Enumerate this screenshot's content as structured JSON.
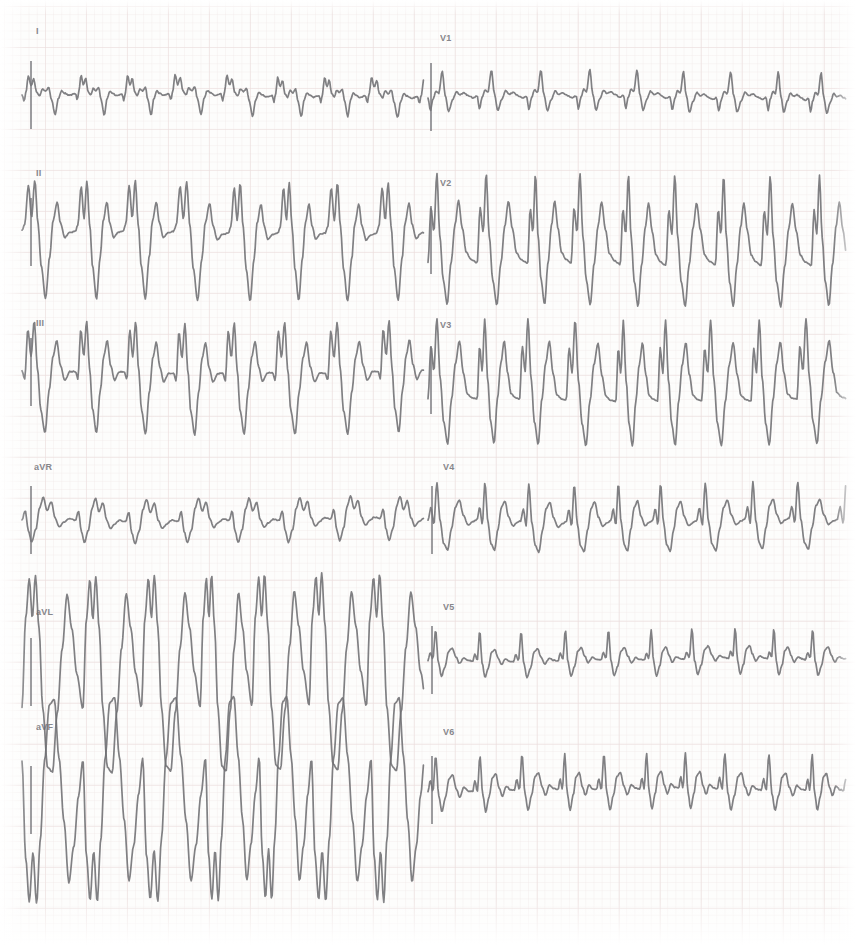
{
  "document": {
    "type": "electrocardiogram",
    "title": "12-lead ECG",
    "paper_color": "#fdfdfc",
    "grid_color": "#c49696",
    "trace_color": "#6e6e72",
    "width": 856,
    "height": 945
  },
  "layout": {
    "columns": 2,
    "rows": 6,
    "column_split_x": 428
  },
  "leads": [
    {
      "label": "I",
      "name": "lead-i",
      "column": "left",
      "row": 0,
      "label_x": 36,
      "label_y": 26,
      "baseline_y": 95,
      "cal_x": 30
    },
    {
      "label": "II",
      "name": "lead-ii",
      "column": "left",
      "row": 1,
      "label_x": 36,
      "label_y": 168,
      "baseline_y": 232,
      "cal_x": 30
    },
    {
      "label": "III",
      "name": "lead-iii",
      "column": "left",
      "row": 2,
      "label_x": 36,
      "label_y": 318,
      "baseline_y": 372,
      "cal_x": 30
    },
    {
      "label": "aVR",
      "name": "lead-avr",
      "column": "left",
      "row": 3,
      "label_x": 34,
      "label_y": 462,
      "baseline_y": 520,
      "cal_x": 30
    },
    {
      "label": "aVL",
      "name": "lead-avl",
      "column": "left",
      "row": 4,
      "label_x": 36,
      "label_y": 607,
      "baseline_y": 672,
      "cal_x": 30
    },
    {
      "label": "aVF",
      "name": "lead-avf",
      "column": "left",
      "row": 5,
      "label_x": 36,
      "label_y": 722,
      "baseline_y": 800,
      "cal_x": 30
    },
    {
      "label": "V1",
      "name": "lead-v1",
      "column": "right",
      "row": 0,
      "label_x": 440,
      "label_y": 33,
      "baseline_y": 97,
      "cal_x": 430
    },
    {
      "label": "V2",
      "name": "lead-v2",
      "column": "right",
      "row": 1,
      "label_x": 440,
      "label_y": 178,
      "baseline_y": 240,
      "cal_x": 430
    },
    {
      "label": "V3",
      "name": "lead-v3",
      "column": "right",
      "row": 2,
      "label_x": 440,
      "label_y": 320,
      "baseline_y": 380,
      "cal_x": 430
    },
    {
      "label": "V4",
      "name": "lead-v4",
      "column": "right",
      "row": 3,
      "label_x": 443,
      "label_y": 462,
      "baseline_y": 520,
      "cal_x": 431
    },
    {
      "label": "V5",
      "name": "lead-v5",
      "column": "right",
      "row": 4,
      "label_x": 443,
      "label_y": 602,
      "baseline_y": 660,
      "cal_x": 431
    },
    {
      "label": "V6",
      "name": "lead-v6",
      "column": "right",
      "row": 5,
      "label_x": 443,
      "label_y": 727,
      "baseline_y": 790,
      "cal_x": 431
    }
  ],
  "chart_data": {
    "type": "line",
    "xlabel": "time",
    "ylabel": "amplitude (mV)",
    "grid": true,
    "legend": "none",
    "series": [
      {
        "name": "I",
        "x_start": 22,
        "x_end": 424,
        "beats": 8,
        "beat_width": 50,
        "amp": 1.0,
        "template": [
          [
            0.0,
            0.0
          ],
          [
            0.04,
            -0.22
          ],
          [
            0.07,
            0.05
          ],
          [
            0.12,
            0.62
          ],
          [
            0.17,
            0.3
          ],
          [
            0.22,
            0.52
          ],
          [
            0.27,
            0.08
          ],
          [
            0.33,
            -0.05
          ],
          [
            0.38,
            0.18
          ],
          [
            0.44,
            0.1
          ],
          [
            0.5,
            0.22
          ],
          [
            0.55,
            -0.18
          ],
          [
            0.62,
            -0.7
          ],
          [
            0.68,
            -0.15
          ],
          [
            0.74,
            0.1
          ],
          [
            0.8,
            0.02
          ],
          [
            0.88,
            -0.05
          ],
          [
            1.0,
            0.0
          ]
        ]
      },
      {
        "name": "II",
        "x_start": 22,
        "x_end": 424,
        "beats": 8,
        "beat_width": 50,
        "amp": 2.15,
        "template": [
          [
            0.0,
            0.0
          ],
          [
            0.05,
            0.1
          ],
          [
            0.12,
            0.7
          ],
          [
            0.18,
            0.2
          ],
          [
            0.24,
            0.78
          ],
          [
            0.3,
            0.1
          ],
          [
            0.36,
            -0.55
          ],
          [
            0.44,
            -1.05
          ],
          [
            0.52,
            -0.4
          ],
          [
            0.58,
            0.15
          ],
          [
            0.66,
            0.45
          ],
          [
            0.72,
            0.12
          ],
          [
            0.8,
            -0.1
          ],
          [
            0.9,
            -0.02
          ],
          [
            1.0,
            0.0
          ]
        ]
      },
      {
        "name": "III",
        "x_start": 22,
        "x_end": 424,
        "beats": 8,
        "beat_width": 50,
        "amp": 2.05,
        "template": [
          [
            0.0,
            0.0
          ],
          [
            0.05,
            -0.12
          ],
          [
            0.11,
            0.68
          ],
          [
            0.17,
            0.25
          ],
          [
            0.23,
            0.82
          ],
          [
            0.29,
            0.05
          ],
          [
            0.35,
            -0.62
          ],
          [
            0.43,
            -1.0
          ],
          [
            0.51,
            -0.3
          ],
          [
            0.58,
            0.25
          ],
          [
            0.65,
            0.5
          ],
          [
            0.72,
            0.1
          ],
          [
            0.8,
            -0.14
          ],
          [
            0.9,
            0.0
          ],
          [
            1.0,
            0.0
          ]
        ]
      },
      {
        "name": "aVR",
        "x_start": 22,
        "x_end": 424,
        "beats": 8,
        "beat_width": 50,
        "amp": 1.05,
        "template": [
          [
            0.0,
            0.0
          ],
          [
            0.06,
            0.3
          ],
          [
            0.12,
            -0.35
          ],
          [
            0.18,
            -0.7
          ],
          [
            0.26,
            -0.3
          ],
          [
            0.33,
            0.38
          ],
          [
            0.4,
            0.72
          ],
          [
            0.47,
            0.3
          ],
          [
            0.55,
            0.58
          ],
          [
            0.62,
            0.05
          ],
          [
            0.7,
            -0.22
          ],
          [
            0.78,
            -0.08
          ],
          [
            0.88,
            0.04
          ],
          [
            1.0,
            0.0
          ]
        ]
      },
      {
        "name": "aVL",
        "x_start": 22,
        "x_end": 424,
        "beats": 7,
        "beat_width": 57,
        "amp": 3.3,
        "template": [
          [
            0.0,
            -0.35
          ],
          [
            0.06,
            0.55
          ],
          [
            0.12,
            0.95
          ],
          [
            0.17,
            0.55
          ],
          [
            0.22,
            0.98
          ],
          [
            0.28,
            0.45
          ],
          [
            0.34,
            -0.35
          ],
          [
            0.42,
            -0.95
          ],
          [
            0.5,
            -1.0
          ],
          [
            0.58,
            -0.4
          ],
          [
            0.66,
            0.25
          ],
          [
            0.74,
            0.8
          ],
          [
            0.82,
            0.45
          ],
          [
            0.9,
            0.0
          ],
          [
            1.0,
            -0.35
          ]
        ]
      },
      {
        "name": "aVF",
        "x_start": 22,
        "x_end": 424,
        "beats": 7,
        "beat_width": 57,
        "amp": 3.4,
        "template": [
          [
            0.0,
            0.4
          ],
          [
            0.06,
            -0.55
          ],
          [
            0.12,
            -0.98
          ],
          [
            0.18,
            -0.5
          ],
          [
            0.24,
            -1.0
          ],
          [
            0.3,
            -0.38
          ],
          [
            0.37,
            0.4
          ],
          [
            0.45,
            0.95
          ],
          [
            0.53,
            1.0
          ],
          [
            0.61,
            0.42
          ],
          [
            0.69,
            -0.2
          ],
          [
            0.77,
            -0.8
          ],
          [
            0.85,
            -0.45
          ],
          [
            0.93,
            0.05
          ],
          [
            1.0,
            0.4
          ]
        ]
      },
      {
        "name": "V1",
        "x_start": 428,
        "x_end": 846,
        "beats": 9,
        "beat_width": 46,
        "amp": 1.15,
        "template": [
          [
            0.0,
            0.0
          ],
          [
            0.05,
            -0.38
          ],
          [
            0.1,
            -0.05
          ],
          [
            0.16,
            0.18
          ],
          [
            0.22,
            0.12
          ],
          [
            0.29,
            0.75
          ],
          [
            0.35,
            0.05
          ],
          [
            0.42,
            -0.42
          ],
          [
            0.5,
            -0.1
          ],
          [
            0.58,
            0.15
          ],
          [
            0.65,
            0.05
          ],
          [
            0.73,
            0.1
          ],
          [
            0.82,
            0.02
          ],
          [
            0.92,
            -0.05
          ],
          [
            1.0,
            0.0
          ]
        ]
      },
      {
        "name": "V2",
        "x_start": 428,
        "x_end": 846,
        "beats": 9,
        "beat_width": 46,
        "amp": 2.3,
        "template": [
          [
            0.0,
            -0.35
          ],
          [
            0.06,
            0.45
          ],
          [
            0.12,
            0.1
          ],
          [
            0.18,
            0.95
          ],
          [
            0.24,
            0.05
          ],
          [
            0.31,
            -0.6
          ],
          [
            0.39,
            -0.95
          ],
          [
            0.47,
            -0.35
          ],
          [
            0.55,
            0.2
          ],
          [
            0.62,
            0.55
          ],
          [
            0.7,
            0.15
          ],
          [
            0.78,
            -0.2
          ],
          [
            0.88,
            -0.3
          ],
          [
            1.0,
            -0.35
          ]
        ]
      },
      {
        "name": "V3",
        "x_start": 428,
        "x_end": 846,
        "beats": 9,
        "beat_width": 46,
        "amp": 2.2,
        "template": [
          [
            0.0,
            -0.3
          ],
          [
            0.06,
            0.5
          ],
          [
            0.12,
            0.12
          ],
          [
            0.18,
            0.92
          ],
          [
            0.25,
            0.0
          ],
          [
            0.32,
            -0.65
          ],
          [
            0.4,
            -0.98
          ],
          [
            0.48,
            -0.3
          ],
          [
            0.56,
            0.25
          ],
          [
            0.64,
            0.58
          ],
          [
            0.72,
            0.1
          ],
          [
            0.8,
            -0.22
          ],
          [
            0.9,
            -0.28
          ],
          [
            1.0,
            -0.3
          ]
        ]
      },
      {
        "name": "V4",
        "x_start": 428,
        "x_end": 846,
        "beats": 9,
        "beat_width": 46,
        "amp": 1.45,
        "template": [
          [
            0.0,
            0.0
          ],
          [
            0.06,
            0.28
          ],
          [
            0.12,
            -0.1
          ],
          [
            0.18,
            0.85
          ],
          [
            0.25,
            -0.05
          ],
          [
            0.32,
            -0.55
          ],
          [
            0.4,
            -0.7
          ],
          [
            0.48,
            -0.2
          ],
          [
            0.56,
            0.3
          ],
          [
            0.64,
            0.45
          ],
          [
            0.72,
            0.1
          ],
          [
            0.82,
            -0.12
          ],
          [
            0.92,
            -0.04
          ],
          [
            1.0,
            0.0
          ]
        ]
      },
      {
        "name": "V5",
        "x_start": 428,
        "x_end": 846,
        "beats": 10,
        "beat_width": 42,
        "amp": 1.1,
        "template": [
          [
            0.0,
            0.0
          ],
          [
            0.05,
            0.22
          ],
          [
            0.11,
            0.05
          ],
          [
            0.17,
            0.92
          ],
          [
            0.23,
            -0.05
          ],
          [
            0.3,
            -0.48
          ],
          [
            0.38,
            -0.2
          ],
          [
            0.46,
            0.28
          ],
          [
            0.54,
            0.38
          ],
          [
            0.62,
            0.12
          ],
          [
            0.7,
            -0.08
          ],
          [
            0.8,
            0.08
          ],
          [
            0.9,
            0.02
          ],
          [
            1.0,
            0.0
          ]
        ]
      },
      {
        "name": "V6",
        "x_start": 428,
        "x_end": 846,
        "beats": 10,
        "beat_width": 42,
        "amp": 1.25,
        "template": [
          [
            0.0,
            0.0
          ],
          [
            0.05,
            0.3
          ],
          [
            0.11,
            0.0
          ],
          [
            0.17,
            0.95
          ],
          [
            0.24,
            -0.1
          ],
          [
            0.31,
            -0.55
          ],
          [
            0.39,
            -0.15
          ],
          [
            0.47,
            0.35
          ],
          [
            0.55,
            0.45
          ],
          [
            0.63,
            0.08
          ],
          [
            0.71,
            -0.15
          ],
          [
            0.8,
            0.12
          ],
          [
            0.9,
            0.02
          ],
          [
            1.0,
            0.0
          ]
        ]
      }
    ]
  }
}
